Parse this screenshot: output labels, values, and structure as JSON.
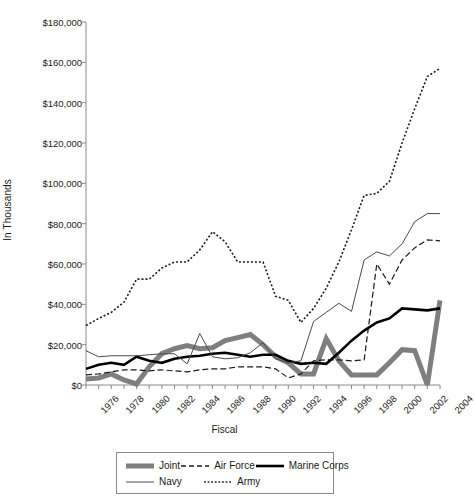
{
  "chart_data": {
    "type": "line",
    "title": "",
    "xlabel": "Fiscal",
    "ylabel": "In Thousands",
    "x": [
      1976,
      1977,
      1978,
      1979,
      1980,
      1981,
      1982,
      1983,
      1984,
      1985,
      1986,
      1987,
      1988,
      1989,
      1990,
      1991,
      1992,
      1993,
      1994,
      1995,
      1996,
      1997,
      1998,
      1999,
      2000,
      2001,
      2002,
      2003,
      2004
    ],
    "xlim": [
      1976,
      2004
    ],
    "ylim": [
      0,
      180000
    ],
    "ytick_values": [
      0,
      20000,
      40000,
      60000,
      80000,
      100000,
      120000,
      140000,
      160000,
      180000
    ],
    "ytick_labels": [
      "$0",
      "$20,000",
      "$40,000",
      "$60,000",
      "$80,000",
      "$100,000",
      "$120,000",
      "$140,000",
      "$160,000",
      "$180,000"
    ],
    "xtick_labels": [
      "1976",
      "1978",
      "1980",
      "1982",
      "1984",
      "1986",
      "1988",
      "1990",
      "1992",
      "1994",
      "1996",
      "1998",
      "2000",
      "2002",
      "2004"
    ],
    "grid": false,
    "legend_position": "bottom",
    "series": [
      {
        "name": "Joint",
        "style": "thick-gray-solid",
        "color": "#7f7f7f",
        "width": 5,
        "dash": "none",
        "values": [
          3000,
          3500,
          5500,
          2500,
          500,
          9000,
          15500,
          18000,
          19500,
          18000,
          18500,
          22000,
          23500,
          25000,
          20000,
          14000,
          11000,
          5500,
          5500,
          23000,
          12000,
          5000,
          5000,
          5000,
          11000,
          17500,
          17000,
          0,
          42000
        ]
      },
      {
        "name": "Air Force",
        "style": "dashed",
        "color": "#1a1a1a",
        "width": 1.2,
        "dash": "6,3",
        "values": [
          5000,
          5500,
          6500,
          7500,
          7500,
          7000,
          7500,
          7000,
          6500,
          7500,
          8000,
          8000,
          9000,
          9000,
          9000,
          8000,
          3500,
          5500,
          12000,
          12500,
          12500,
          12000,
          12500,
          60000,
          50000,
          62000,
          68000,
          72000,
          71500
        ]
      },
      {
        "name": "Marine Corps",
        "style": "thick-black-solid",
        "color": "#000000",
        "width": 2.6,
        "dash": "none",
        "values": [
          8000,
          10000,
          11000,
          10000,
          14000,
          12000,
          11000,
          13000,
          14000,
          14500,
          15500,
          16000,
          15000,
          14000,
          15000,
          15000,
          12000,
          10500,
          11000,
          10500,
          16000,
          22000,
          27000,
          31000,
          33000,
          38000,
          37500,
          37000,
          38000
        ]
      },
      {
        "name": "Navy",
        "style": "thin-solid",
        "color": "#4a4a4a",
        "width": 1,
        "dash": "none",
        "values": [
          17000,
          14000,
          14500,
          14500,
          14500,
          15000,
          15500,
          15500,
          10500,
          25500,
          14000,
          13000,
          13500,
          16000,
          21000,
          13000,
          11000,
          12000,
          31500,
          36000,
          40500,
          36500,
          62000,
          66000,
          64000,
          70000,
          81000,
          85000,
          85000
        ]
      },
      {
        "name": "Army",
        "style": "dotted",
        "color": "#1a1a1a",
        "width": 1.6,
        "dash": "2,2",
        "values": [
          29500,
          33000,
          36000,
          41000,
          52500,
          52500,
          58000,
          61000,
          61000,
          67000,
          76000,
          71000,
          61000,
          61000,
          61000,
          44000,
          42000,
          31000,
          38000,
          48000,
          61000,
          77000,
          94000,
          95000,
          101000,
          120000,
          137000,
          153000,
          157000
        ]
      }
    ]
  },
  "axes": {
    "y_title": "In Thousands",
    "x_title": "Fiscal"
  },
  "legend": {
    "items": [
      {
        "label": "Joint",
        "icon": "line-swatch-thick-gray"
      },
      {
        "label": "Air Force",
        "icon": "line-swatch-dashed"
      },
      {
        "label": "Marine Corps",
        "icon": "line-swatch-thick-black"
      },
      {
        "label": "Navy",
        "icon": "line-swatch-thin"
      },
      {
        "label": "Army",
        "icon": "line-swatch-dotted"
      }
    ]
  },
  "colors": {
    "joint": "#7f7f7f",
    "air_force": "#1a1a1a",
    "marine_corps": "#000000",
    "navy": "#4a4a4a",
    "army": "#1a1a1a",
    "axis": "#8a8a8a",
    "text": "#1a1a1a",
    "background": "#ffffff"
  }
}
